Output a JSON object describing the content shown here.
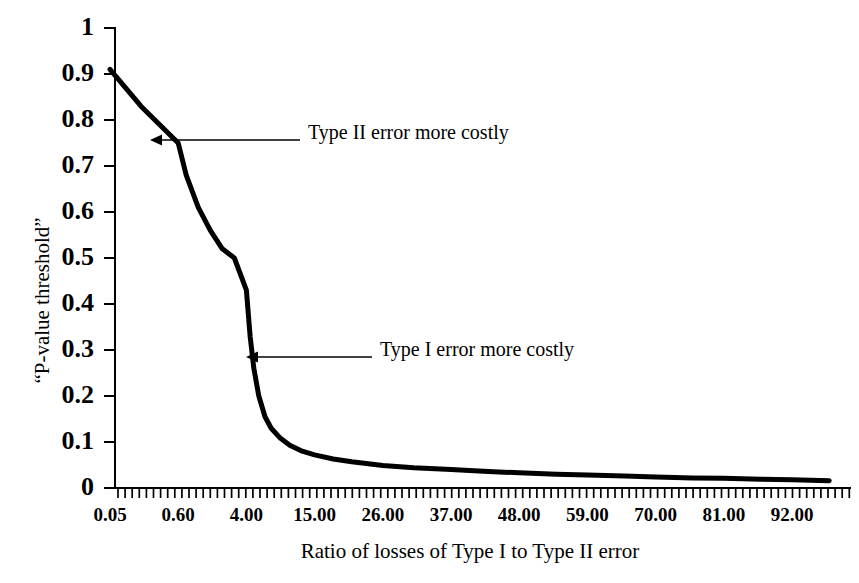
{
  "chart_data": {
    "type": "line",
    "title": "",
    "xlabel": "Ratio of losses of Type I to Type II error",
    "ylabel": "“P-value threshold”",
    "xlim": [
      0,
      100
    ],
    "ylim": [
      0,
      1
    ],
    "grid": false,
    "legend": "none",
    "xticklabels": [
      "0.05",
      "0.60",
      "4.00",
      "15.00",
      "26.00",
      "37.00",
      "48.00",
      "59.00",
      "70.00",
      "81.00",
      "92.00"
    ],
    "yticklabels": [
      "0",
      "0.1",
      "0.2",
      "0.3",
      "0.4",
      "0.5",
      "0.6",
      "0.7",
      "0.8",
      "0.9",
      "1"
    ],
    "series": [
      {
        "name": "P-value threshold",
        "color": "#000000",
        "x": [
          0.05,
          0.3,
          0.6,
          1.0,
          1.6,
          2.2,
          2.8,
          3.4,
          4.0,
          4.6,
          5.2,
          6.0,
          7.0,
          8.0,
          9.5,
          11.0,
          13.0,
          15.0,
          18.0,
          21.0,
          26.0,
          31.0,
          37.0,
          43.0,
          48.0,
          54.0,
          59.0,
          65.0,
          70.0,
          76.0,
          81.0,
          87.0,
          92.0,
          98.0
        ],
        "values": [
          0.91,
          0.83,
          0.75,
          0.68,
          0.61,
          0.56,
          0.52,
          0.5,
          0.43,
          0.33,
          0.26,
          0.2,
          0.155,
          0.13,
          0.108,
          0.093,
          0.08,
          0.072,
          0.063,
          0.057,
          0.049,
          0.044,
          0.04,
          0.036,
          0.033,
          0.03,
          0.028,
          0.026,
          0.024,
          0.022,
          0.021,
          0.019,
          0.018,
          0.016
        ]
      }
    ],
    "annotations": [
      {
        "id": "type-2-annotation",
        "text": "Type II error more costly",
        "arrow_target_value": 0.755,
        "arrow_target_x": 0.6
      },
      {
        "id": "type-1-annotation",
        "text": "Type I error more costly",
        "arrow_target_value": 0.285,
        "arrow_target_x": 4.9
      }
    ]
  },
  "axis": {
    "y_title": "“P-value threshold”",
    "x_title": "Ratio of losses of Type I to Type II error"
  },
  "annotations": {
    "type_two": "Type II error more costly",
    "type_one": "Type I error more costly"
  },
  "colors": {
    "curve": "#000000",
    "axis": "#000000",
    "background": "#ffffff"
  }
}
